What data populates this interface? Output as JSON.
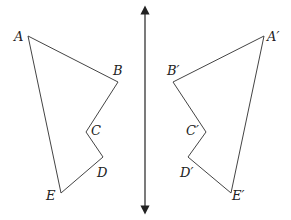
{
  "diagram": {
    "type": "reflection across a vertical line",
    "axis": {
      "x": 145,
      "y1": 10,
      "y2": 210,
      "arrows": "both ends"
    },
    "original": {
      "vertices": [
        {
          "label": "A",
          "x": 28,
          "y": 36,
          "lx": 14,
          "ly": 41
        },
        {
          "label": "B",
          "x": 118,
          "y": 82,
          "lx": 113,
          "ly": 75
        },
        {
          "label": "C",
          "x": 86,
          "y": 132,
          "lx": 91,
          "ly": 135
        },
        {
          "label": "D",
          "x": 103,
          "y": 157,
          "lx": 97,
          "ly": 177
        },
        {
          "label": "E",
          "x": 61,
          "y": 193,
          "lx": 46,
          "ly": 200
        }
      ]
    },
    "image": {
      "vertices": [
        {
          "label": "A′",
          "x": 264,
          "y": 36,
          "lx": 267,
          "ly": 41
        },
        {
          "label": "B′",
          "x": 173,
          "y": 82,
          "lx": 167,
          "ly": 75
        },
        {
          "label": "C′",
          "x": 206,
          "y": 132,
          "lx": 186,
          "ly": 135
        },
        {
          "label": "D′",
          "x": 188,
          "y": 157,
          "lx": 180,
          "ly": 177
        },
        {
          "label": "E′",
          "x": 231,
          "y": 193,
          "lx": 232,
          "ly": 200
        }
      ]
    }
  }
}
